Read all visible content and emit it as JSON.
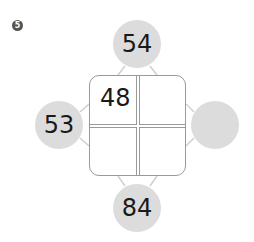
{
  "problem": {
    "number": "5"
  },
  "circles": {
    "top": "54",
    "left": "53",
    "right": "",
    "bottom": "84"
  },
  "grid": {
    "cells": [
      "48",
      "",
      "",
      ""
    ]
  },
  "colors": {
    "circle_fill": "#dcdcdc",
    "grid_border": "#9a9a9a",
    "marker": "#555555"
  }
}
